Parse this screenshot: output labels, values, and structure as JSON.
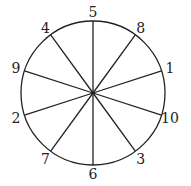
{
  "diagram": {
    "type": "circle-divided-into-sectors",
    "center": [
      93,
      93
    ],
    "radius": 72,
    "sector_count": 10,
    "stroke_color": "#222222",
    "labels": [
      {
        "text": "5",
        "angle": 0
      },
      {
        "text": "8",
        "angle": 36
      },
      {
        "text": "1",
        "angle": 72
      },
      {
        "text": "10",
        "angle": 108
      },
      {
        "text": "3",
        "angle": 144
      },
      {
        "text": "6",
        "angle": 180
      },
      {
        "text": "7",
        "angle": 216
      },
      {
        "text": "2",
        "angle": 252
      },
      {
        "text": "9",
        "angle": 288
      },
      {
        "text": "4",
        "angle": 324
      }
    ]
  }
}
